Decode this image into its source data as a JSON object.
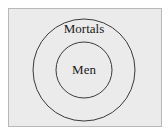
{
  "diagram": {
    "type": "euler-nested-circles",
    "outer_set": {
      "label": "Mortals"
    },
    "inner_set": {
      "label": "Men"
    },
    "relation": "Men ⊂ Mortals",
    "colors": {
      "background": "#ebebeb",
      "frame_border": "#b8b8b8",
      "circle_stroke": "#3a3a3a",
      "text": "#1a1a1a"
    }
  }
}
